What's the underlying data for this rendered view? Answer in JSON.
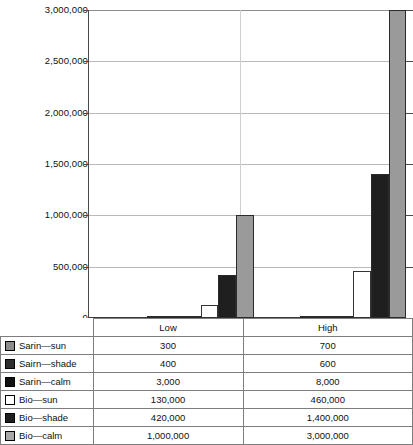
{
  "chart_data": {
    "type": "bar",
    "title": "",
    "xlabel": "",
    "ylabel": "",
    "categories": [
      "Low",
      "High"
    ],
    "ylim": [
      0,
      3000000
    ],
    "ytick_values": [
      3000000,
      2500000,
      2000000,
      1500000,
      1000000,
      500000,
      0
    ],
    "ytick_labels": [
      "3,000,000",
      "2,500,000",
      "2,000,000",
      "1,500,000",
      "1,000,000",
      "500,000",
      "0"
    ],
    "grid": true,
    "legend_position": "table-left-column",
    "series": [
      {
        "name": "Sarin—sun",
        "values": [
          300,
          700
        ],
        "display": [
          "300",
          "700"
        ],
        "color": "#8c8c8c",
        "swatch": "#8c8c8c"
      },
      {
        "name": "Sairn—shade",
        "values": [
          400,
          600
        ],
        "display": [
          "400",
          "600"
        ],
        "color": "#3a3a3a",
        "swatch": "#2e2e2e"
      },
      {
        "name": "Sarin—calm",
        "values": [
          3000,
          8000
        ],
        "display": [
          "3,000",
          "8,000"
        ],
        "color": "#111111",
        "swatch": "#111111"
      },
      {
        "name": "Bio—sun",
        "values": [
          130000,
          460000
        ],
        "display": [
          "130,000",
          "460,000"
        ],
        "color": "#ffffff",
        "swatch": "#ffffff"
      },
      {
        "name": "Bio—shade",
        "values": [
          420000,
          1400000
        ],
        "display": [
          "420,000",
          "1,400,000"
        ],
        "color": "#1f1f1f",
        "swatch": "#1f1f1f"
      },
      {
        "name": "Bio—calm",
        "values": [
          1000000,
          3000000
        ],
        "display": [
          "1,000,000",
          "3,000,000"
        ],
        "color": "#9a9a9a",
        "swatch": "#a8a8a8"
      }
    ]
  },
  "table": {
    "header": {
      "label_col": "",
      "low": "Low",
      "high": "High"
    },
    "rows": [
      {
        "label": "Sarin—sun",
        "low": "300",
        "high": "700"
      },
      {
        "label": "Sairn—shade",
        "low": "400",
        "high": "600"
      },
      {
        "label": "Sarin—calm",
        "low": "3,000",
        "high": "8,000"
      },
      {
        "label": "Bio—sun",
        "low": "130,000",
        "high": "460,000"
      },
      {
        "label": "Bio—shade",
        "low": "420,000",
        "high": "1,400,000"
      },
      {
        "label": "Bio—calm",
        "low": "1,000,000",
        "high": "3,000,000"
      }
    ]
  }
}
